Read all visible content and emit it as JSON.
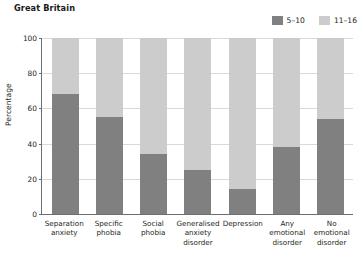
{
  "chart_data": {
    "type": "bar",
    "subtype": "stacked-bar-100-percent",
    "title": "Great Britain",
    "xlabel": "",
    "ylabel": "Percentage",
    "ylim": [
      0,
      100
    ],
    "yticks": [
      0,
      20,
      40,
      60,
      80,
      100
    ],
    "grid": true,
    "legend_position": "top-right",
    "categories": [
      "Separation anxiety",
      "Specific phobia",
      "Social phobia",
      "Generalised anxiety disorder",
      "Depression",
      "Any emotional disorder",
      "No emotional disorder"
    ],
    "series": [
      {
        "name": "5–10",
        "color": "#808080",
        "values": [
          68,
          55,
          34,
          25,
          14,
          38,
          54
        ]
      },
      {
        "name": "11–16",
        "color": "#cccccc",
        "values": [
          32,
          45,
          66,
          75,
          86,
          62,
          46
        ]
      }
    ]
  },
  "legend": [
    {
      "label": "5–10",
      "color": "#808080"
    },
    {
      "label": "11–16",
      "color": "#cccccc"
    }
  ],
  "axes": {
    "y_title": "Percentage",
    "y_ticks": [
      "100",
      "80",
      "60",
      "40",
      "20",
      "0"
    ]
  },
  "x_labels": [
    "Separation anxiety",
    "Specific phobia",
    "Social phobia",
    "Generalised anxiety disorder",
    "Depression",
    "Any emotional disorder",
    "No emotional disorder"
  ],
  "colors": {
    "series_5_10": "#808080",
    "series_11_16": "#cccccc",
    "axis": "#6d6e71",
    "grid": "#d9d9d9",
    "text": "#231f20"
  }
}
